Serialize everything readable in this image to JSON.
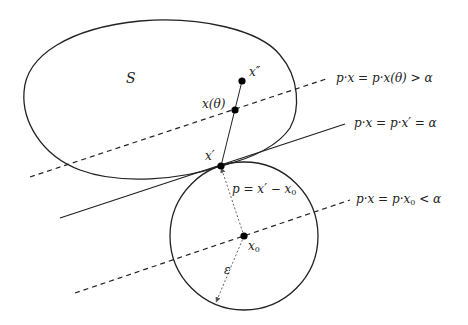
{
  "figure": {
    "type": "separating-hyperplane-diagram",
    "set_label": "S",
    "points": {
      "x_double_prime": {
        "label": "x″",
        "pos": [
          242,
          81
        ]
      },
      "x_theta": {
        "label": "x(θ)",
        "pos": [
          235,
          110
        ]
      },
      "x_prime": {
        "label": "x′",
        "pos": [
          221,
          166
        ]
      },
      "x0": {
        "label_base": "x",
        "label_sub": "0",
        "pos": [
          244,
          236
        ]
      }
    },
    "ball": {
      "center": [
        244,
        236
      ],
      "radius": 75,
      "radius_label": "ε"
    },
    "vector_label": {
      "text_pre": "p = x′ − x",
      "sub": "0"
    },
    "lines": [
      {
        "name": "upper-hyperplane",
        "style": "dashed",
        "label": "p·x = p·x(θ) > α"
      },
      {
        "name": "supporting-hyperplane",
        "style": "solid",
        "label": "p·x = p·x′ = α"
      },
      {
        "name": "lower-hyperplane",
        "style": "dashed",
        "label_pre": "p·x = p·x",
        "label_sub": "0",
        "label_post": " < α"
      }
    ],
    "colors": {
      "stroke": "#222222",
      "background": "#ffffff",
      "dotted": "#555555"
    }
  }
}
